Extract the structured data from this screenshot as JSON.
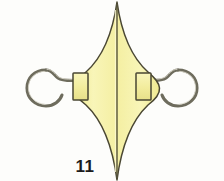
{
  "plate": {
    "figure_number": "11",
    "background_color": "#fdfdfb",
    "body_fill_color": "#f6f2a2",
    "body_fill_highlight": "#fbf9cf",
    "outline_color": "#4a4733",
    "metal_color": "#8c8a7a",
    "metal_highlight": "#d8d6c8",
    "label_color": "#1c1c1c"
  },
  "artifact": {
    "name": "double-hooked ornament",
    "parts": [
      {
        "name": "left-hook",
        "shape": "c-hook-open-left"
      },
      {
        "name": "left-hook-shank",
        "shape": "s-curve-rod"
      },
      {
        "name": "left-block",
        "shape": "rectangle"
      },
      {
        "name": "central-body",
        "shape": "lens-diamond"
      },
      {
        "name": "central-ridge",
        "shape": "vertical-line"
      },
      {
        "name": "right-block",
        "shape": "rectangle"
      },
      {
        "name": "right-hook-shank",
        "shape": "s-curve-rod"
      },
      {
        "name": "right-hook",
        "shape": "c-hook-open-right"
      }
    ]
  }
}
